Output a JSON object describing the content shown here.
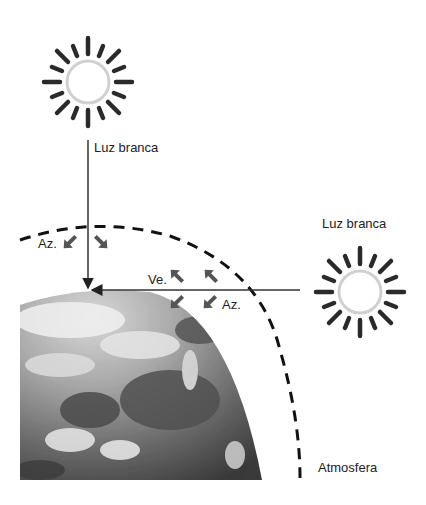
{
  "diagram": {
    "title": "",
    "labels": {
      "top_light": "Luz branca",
      "right_light": "Luz branca",
      "blue_left": "Az.",
      "violet": "Ve.",
      "blue_right": "Az.",
      "atmosphere": "Atmosfera"
    },
    "elements": {
      "sun_top": {
        "icon": "sun-icon",
        "center": [
          88,
          82
        ]
      },
      "sun_right": {
        "icon": "sun-icon",
        "center": [
          360,
          292
        ]
      },
      "earth": {
        "icon": "earth-globe-image"
      },
      "atmosphere_arc": {
        "style": "dashed"
      }
    },
    "colors": {
      "ray": "#333333",
      "arrow": "#555555",
      "dash": "#111111",
      "sun_rays": "#2a2a2a",
      "sun_disc": "#d9d9d9"
    }
  }
}
